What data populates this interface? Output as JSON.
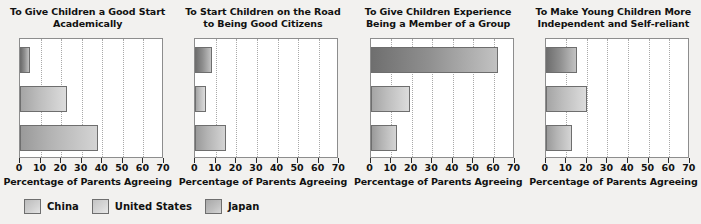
{
  "chart_data": {
    "type": "bar",
    "orientation": "horizontal",
    "title": "",
    "xlabel": "Percentage of Parents Agreeing",
    "ylabel": "",
    "xlim": [
      0,
      70
    ],
    "xticks": [
      0,
      10,
      20,
      30,
      40,
      50,
      60,
      70
    ],
    "grid": true,
    "legend_position": "bottom-left",
    "categories": [
      "China",
      "United States",
      "Japan"
    ],
    "panels": [
      {
        "title": "To Give Children a Good Start Academically",
        "xlabel": "Percentage of Parents Agreeing",
        "series": [
          {
            "name": "China",
            "value": 5
          },
          {
            "name": "United States",
            "value": 23
          },
          {
            "name": "Japan",
            "value": 38
          }
        ]
      },
      {
        "title": "To Start Children on the Road to Being Good Citizens",
        "xlabel": "Percentage of Parents Agreeing",
        "series": [
          {
            "name": "China",
            "value": 8
          },
          {
            "name": "United States",
            "value": 5
          },
          {
            "name": "Japan",
            "value": 15
          }
        ]
      },
      {
        "title": "To Give Children Experience Being a Member of a Group",
        "xlabel": "Percentage of Parents Agreeing",
        "series": [
          {
            "name": "China",
            "value": 62
          },
          {
            "name": "United States",
            "value": 19
          },
          {
            "name": "Japan",
            "value": 13
          }
        ]
      },
      {
        "title": "To Make Young Children More Independent and Self-reliant",
        "xlabel": "Percentage of Parents Agreeing",
        "series": [
          {
            "name": "China",
            "value": 15
          },
          {
            "name": "United States",
            "value": 20
          },
          {
            "name": "Japan",
            "value": 13
          }
        ]
      }
    ],
    "legend": [
      {
        "label": "China",
        "color": "#cfcfcf"
      },
      {
        "label": "United States",
        "color": "#d8d8d8"
      },
      {
        "label": "Japan",
        "color": "#b8b8b8"
      }
    ]
  }
}
